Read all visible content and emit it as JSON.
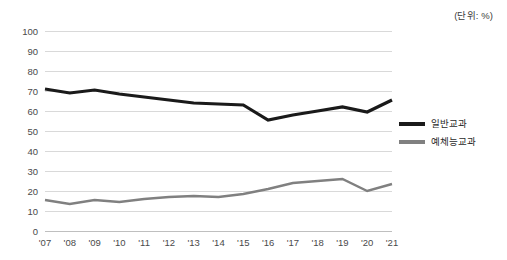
{
  "unit_note": "(단위: %)",
  "legend": {
    "items": [
      {
        "label": "일반교과",
        "color": "#1a1a1a"
      },
      {
        "label": "예체능교과",
        "color": "#808080"
      }
    ]
  },
  "chart_data": {
    "type": "line",
    "title": "",
    "subtitle": "",
    "xlabel": "",
    "ylabel": "",
    "unit": "(단위: %)",
    "grid": true,
    "legend_position": "right",
    "ylim": [
      0,
      100
    ],
    "ytick_step": 10,
    "ytick_labels": [
      "0",
      "10",
      "20",
      "30",
      "40",
      "50",
      "60",
      "70",
      "80",
      "90",
      "100"
    ],
    "categories": [
      "'07",
      "'08",
      "'09",
      "'10",
      "'11",
      "'12",
      "'13",
      "'14",
      "'15",
      "'16",
      "'17",
      "'18",
      "'19",
      "'20",
      "'21"
    ],
    "series": [
      {
        "name": "일반교과",
        "color": "#1a1a1a",
        "width": 3.2,
        "values": [
          71,
          69,
          70.5,
          68.5,
          67,
          65.5,
          64,
          63.5,
          63,
          55.5,
          58,
          60,
          62,
          59.5,
          65.5
        ]
      },
      {
        "name": "예체능교과",
        "color": "#808080",
        "width": 2.4,
        "values": [
          15.5,
          13.5,
          15.5,
          14.5,
          16,
          17,
          17.5,
          17,
          18.5,
          21,
          24,
          25,
          26,
          20,
          23.5
        ]
      }
    ]
  },
  "plot_geometry": {
    "left": 45,
    "right": 392,
    "top": 31,
    "bottom": 231
  }
}
